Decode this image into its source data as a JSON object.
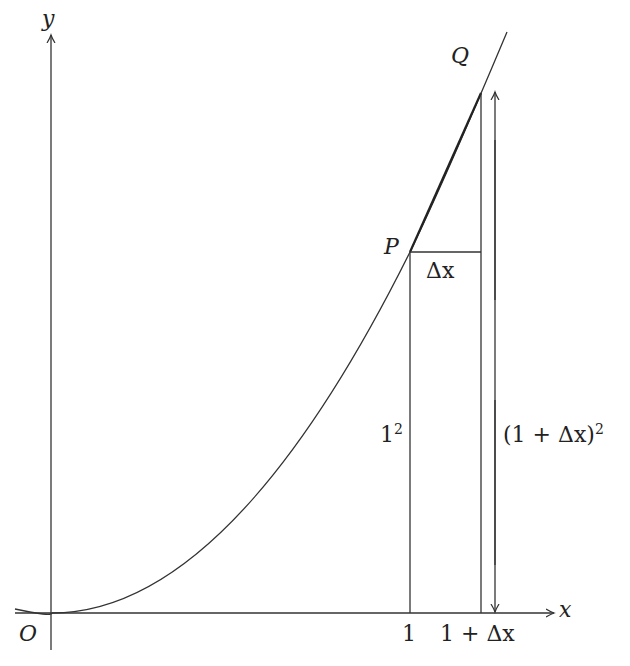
{
  "diagram": {
    "axes": {
      "x_label": "x",
      "y_label": "y",
      "origin_label": "O"
    },
    "points": {
      "P": "P",
      "Q": "Q"
    },
    "ticks": {
      "x1": "1",
      "x2": "1 + Δx"
    },
    "annotations": {
      "delta_x": "Δx",
      "height_P_base": "1",
      "height_P_exp": "2",
      "height_Q_base": "(1 + Δx)",
      "height_Q_exp": "2"
    },
    "curve": "y = x²",
    "colors": {
      "stroke": "#333333",
      "background": "#ffffff"
    }
  }
}
